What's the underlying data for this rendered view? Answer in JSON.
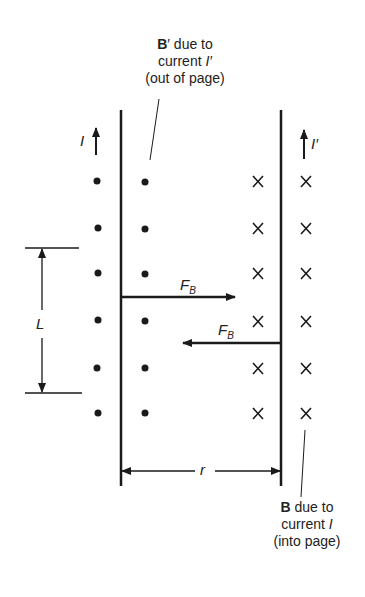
{
  "diagram": {
    "type": "two parallel current-carrying wires with magnetic fields and forces",
    "left_wire": {
      "current_label": "I",
      "current_direction": "up",
      "field_symbol": "dot (out of page)"
    },
    "right_wire": {
      "current_label": "I′",
      "current_direction": "up",
      "field_symbol": "cross (into page)"
    },
    "labels": {
      "top_annotation": {
        "line1_bold": "B",
        "line1_rest": "′ due to",
        "line2": "current ",
        "line2_ital": "I′",
        "line3": "(out of page)"
      },
      "bottom_annotation": {
        "line1_bold": "B",
        "line1_rest": " due to",
        "line2": "current ",
        "line2_ital": "I",
        "line3": "(into page)"
      },
      "force_label_main": "F",
      "force_label_sub": "B",
      "length_label": "L",
      "separation_label": "r",
      "cross_glyph": "×"
    },
    "colors": {
      "line": "#1a1a1a",
      "background": "#ffffff"
    }
  }
}
